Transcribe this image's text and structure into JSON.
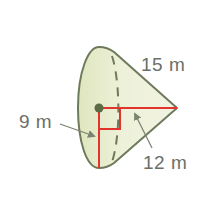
{
  "diagram": {
    "type": "cone-on-side",
    "colors": {
      "fill": "#eef1d9",
      "fill_shade": "#dfe6bf",
      "outline": "#6e7a5c",
      "measure_lines": "#e0342c",
      "label_text": "#6b6f6a",
      "arrow": "#7b8470"
    },
    "labels": {
      "slant_height": "15 m",
      "radius": "9 m",
      "height": "12 m"
    }
  }
}
